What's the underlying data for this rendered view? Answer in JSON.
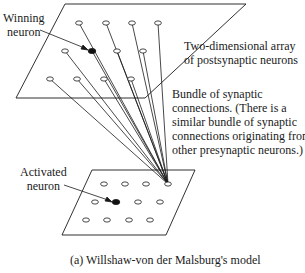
{
  "labels": {
    "winning_neuron": [
      "Winning",
      "neuron"
    ],
    "postsynaptic_array": [
      "Two-dimensional array",
      "of postsynaptic neurons"
    ],
    "bundle": [
      "Bundle of synaptic",
      "connections. (There is a",
      "similar bundle of synaptic",
      "connections originating from",
      "other presynaptic neurons.)"
    ],
    "activated_neuron": [
      "Activated",
      "neuron"
    ],
    "caption": "(a) Willshaw-von der Malsburg's model"
  },
  "colors": {
    "line": "#1a1a1a",
    "background": "#ffffff"
  },
  "top_plane": {
    "corners": [
      [
        65,
        4
      ],
      [
        246,
        4
      ],
      [
        145,
        98
      ],
      [
        16,
        98
      ]
    ],
    "neurons": [
      {
        "x": 79,
        "y": 23
      },
      {
        "x": 106,
        "y": 23
      },
      {
        "x": 132,
        "y": 23
      },
      {
        "x": 158,
        "y": 23
      },
      {
        "x": 65,
        "y": 51
      },
      {
        "x": 92,
        "y": 51,
        "filled": true
      },
      {
        "x": 117,
        "y": 51
      },
      {
        "x": 143,
        "y": 51
      },
      {
        "x": 50,
        "y": 79
      },
      {
        "x": 77,
        "y": 79
      },
      {
        "x": 104,
        "y": 79
      },
      {
        "x": 131,
        "y": 79
      }
    ]
  },
  "bottom_plane": {
    "corners": [
      [
        92,
        170
      ],
      [
        195,
        170
      ],
      [
        166,
        235
      ],
      [
        62,
        235
      ]
    ],
    "neurons": [
      {
        "x": 104,
        "y": 184
      },
      {
        "x": 125,
        "y": 184
      },
      {
        "x": 146,
        "y": 184
      },
      {
        "x": 168,
        "y": 184,
        "source": true
      },
      {
        "x": 95,
        "y": 202
      },
      {
        "x": 116,
        "y": 202,
        "filled": true
      },
      {
        "x": 138,
        "y": 202
      },
      {
        "x": 160,
        "y": 202
      },
      {
        "x": 86,
        "y": 220
      },
      {
        "x": 107,
        "y": 220
      },
      {
        "x": 129,
        "y": 220
      },
      {
        "x": 150,
        "y": 220
      }
    ]
  }
}
